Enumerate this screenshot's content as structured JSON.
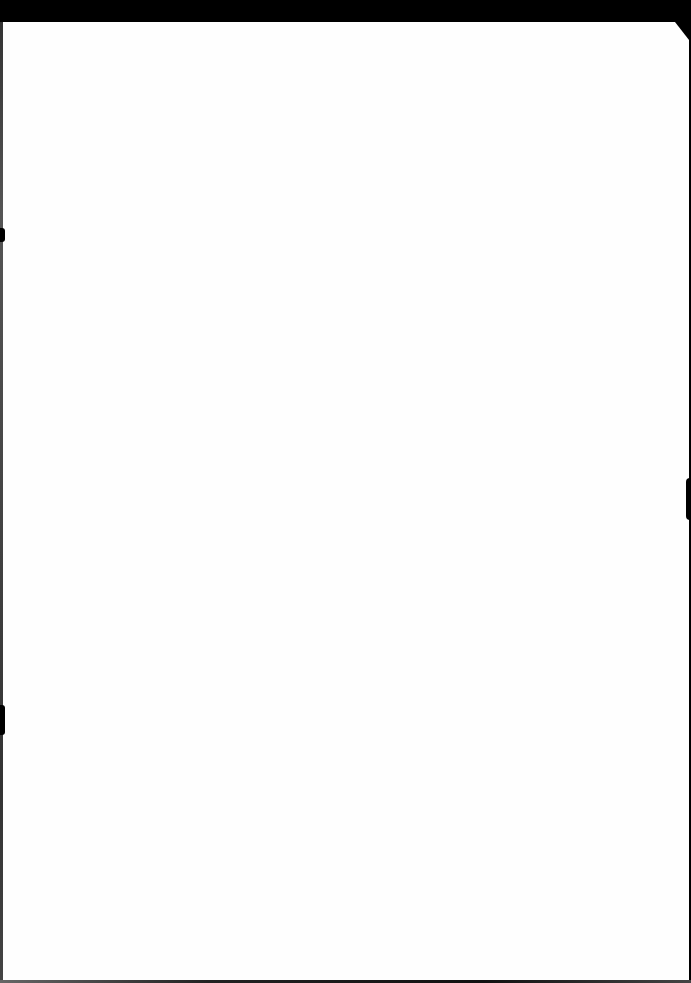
{
  "document": {
    "type": "scanned-page",
    "content": "",
    "is_blank": true
  },
  "colors": {
    "paper": "#fefefe",
    "scan_background": "#000000"
  }
}
